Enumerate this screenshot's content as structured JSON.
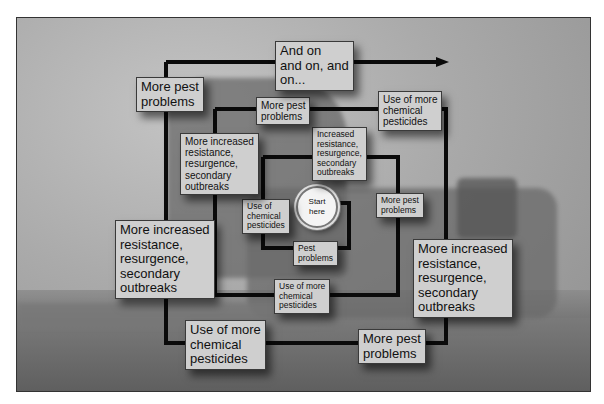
{
  "diagram": {
    "type": "spiral-flow",
    "background": "grayscale photo of crop duster / harvester silhouette",
    "start": {
      "label": "Start\nhere"
    },
    "labels": [
      {
        "id": "pest-problems-inner",
        "text": "Pest\nproblems"
      },
      {
        "id": "use-chemical-pesticides",
        "text": "Use of\nchemical\npesticides"
      },
      {
        "id": "increased-resistance",
        "text": "Increased\nresistance,\nresurgence,\nsecondary\noutbreaks"
      },
      {
        "id": "more-pest-problems-1",
        "text": "More pest\nproblems"
      },
      {
        "id": "use-more-chemical-1",
        "text": "Use of more\nchemical\npesticides"
      },
      {
        "id": "more-increased-resistance-1",
        "text": "More increased\nresistance,\nresurgence,\nsecondary\noutbreaks"
      },
      {
        "id": "more-pest-problems-2",
        "text": "More pest\nproblems"
      },
      {
        "id": "use-more-chemical-2",
        "text": "Use of more\nchemical\npesticides"
      },
      {
        "id": "more-increased-resistance-2",
        "text": "More increased\nresistance,\nresurgence,\nsecondary\noutbreaks"
      },
      {
        "id": "more-pest-problems-3",
        "text": "More pest\nproblems"
      },
      {
        "id": "use-more-chemical-3",
        "text": "Use of more\nchemical\npesticides"
      },
      {
        "id": "more-increased-resistance-3",
        "text": "More increased\nresistance,\nresurgence,\nsecondary\noutbreaks"
      },
      {
        "id": "more-pest-problems-4",
        "text": "More pest\nproblems"
      },
      {
        "id": "and-on",
        "text": "And on\nand on, and\non..."
      }
    ],
    "colors": {
      "line": "#0a0a0a",
      "label_bg": "#cfcfcf",
      "frame_border": "#333333"
    }
  }
}
